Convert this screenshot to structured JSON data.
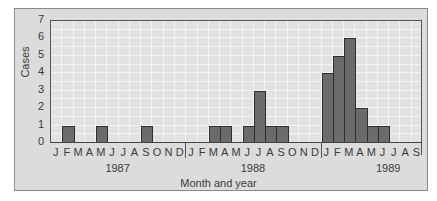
{
  "chart_data": {
    "type": "bar",
    "title": "",
    "xlabel": "Month and year",
    "ylabel": "Cases",
    "ylim": [
      0,
      7
    ],
    "yticks": [
      0,
      1,
      2,
      3,
      4,
      5,
      6,
      7
    ],
    "grid": true,
    "legend": null,
    "years": [
      {
        "label": "1987",
        "start_index": 0,
        "count": 12
      },
      {
        "label": "1988",
        "start_index": 12,
        "count": 12
      },
      {
        "label": "1989",
        "start_index": 24,
        "count": 9
      }
    ],
    "categories": [
      "J",
      "F",
      "M",
      "A",
      "M",
      "J",
      "J",
      "A",
      "S",
      "O",
      "N",
      "D",
      "J",
      "F",
      "M",
      "A",
      "M",
      "J",
      "J",
      "A",
      "S",
      "O",
      "N",
      "D",
      "J",
      "F",
      "M",
      "A",
      "M",
      "J",
      "J",
      "A",
      "S"
    ],
    "category_full": [
      "Jan 1987",
      "Feb 1987",
      "Mar 1987",
      "Apr 1987",
      "May 1987",
      "Jun 1987",
      "Jul 1987",
      "Aug 1987",
      "Sep 1987",
      "Oct 1987",
      "Nov 1987",
      "Dec 1987",
      "Jan 1988",
      "Feb 1988",
      "Mar 1988",
      "Apr 1988",
      "May 1988",
      "Jun 1988",
      "Jul 1988",
      "Aug 1988",
      "Sep 1988",
      "Oct 1988",
      "Nov 1988",
      "Dec 1988",
      "Jan 1989",
      "Feb 1989",
      "Mar 1989",
      "Apr 1989",
      "May 1989",
      "Jun 1989",
      "Jul 1989",
      "Aug 1989",
      "Sep 1989"
    ],
    "values": [
      0,
      1,
      0,
      0,
      1,
      0,
      0,
      0,
      1,
      0,
      0,
      0,
      0,
      0,
      1,
      1,
      0,
      1,
      3,
      1,
      1,
      0,
      0,
      0,
      4,
      5,
      6,
      2,
      1,
      1,
      0,
      0,
      0
    ]
  },
  "colors": {
    "bar_fill": "#6b6b6b",
    "bar_edge": "#2e2e2e",
    "plot_bg": "#e2e2e2",
    "panel_bg": "#dcdcdc",
    "grid": "#f4f4f4"
  }
}
